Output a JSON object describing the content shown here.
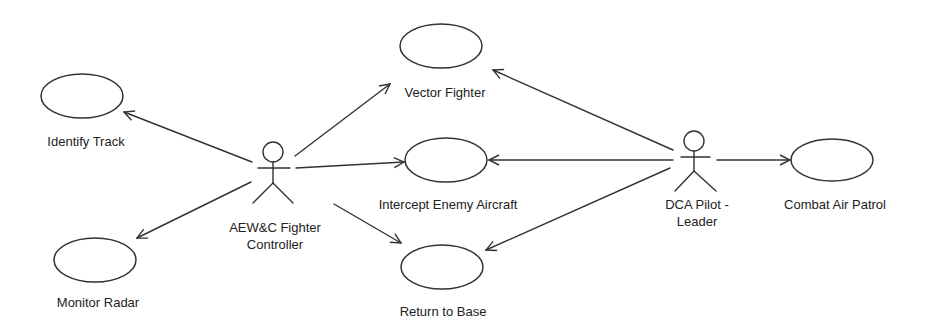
{
  "diagram": {
    "type": "UML use case diagram",
    "colors": {
      "stroke": "#333333",
      "text": "#222222",
      "background": "#ffffff"
    },
    "actors": [
      {
        "id": "aewc",
        "label_line1": "AEW&C Fighter",
        "label_line2": "Controller"
      },
      {
        "id": "dca",
        "label_line1": "DCA Pilot -",
        "label_line2": "Leader"
      }
    ],
    "use_cases": [
      {
        "id": "identify_track",
        "label": "Identify Track"
      },
      {
        "id": "monitor_radar",
        "label": "Monitor Radar"
      },
      {
        "id": "vector_fighter",
        "label": "Vector Fighter"
      },
      {
        "id": "intercept_enemy_aircraft",
        "label": "Intercept Enemy Aircraft"
      },
      {
        "id": "return_to_base",
        "label": "Return to Base"
      },
      {
        "id": "combat_air_patrol",
        "label": "Combat Air Patrol"
      }
    ],
    "associations": [
      {
        "from": "aewc",
        "to": "identify_track"
      },
      {
        "from": "aewc",
        "to": "monitor_radar"
      },
      {
        "from": "aewc",
        "to": "vector_fighter"
      },
      {
        "from": "aewc",
        "to": "intercept_enemy_aircraft"
      },
      {
        "from": "aewc",
        "to": "return_to_base"
      },
      {
        "from": "dca",
        "to": "vector_fighter"
      },
      {
        "from": "dca",
        "to": "intercept_enemy_aircraft"
      },
      {
        "from": "dca",
        "to": "return_to_base"
      },
      {
        "from": "dca",
        "to": "combat_air_patrol"
      }
    ]
  }
}
